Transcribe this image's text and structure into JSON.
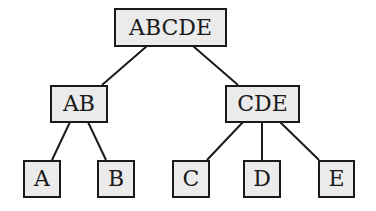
{
  "diagram": {
    "type": "tree",
    "nodes": [
      {
        "id": "ABCDE",
        "label": "ABCDE",
        "x": 114,
        "y": 8,
        "w": 113,
        "h": 39
      },
      {
        "id": "AB",
        "label": "AB",
        "x": 50,
        "y": 85,
        "w": 58,
        "h": 38
      },
      {
        "id": "CDE",
        "label": "CDE",
        "x": 225,
        "y": 85,
        "w": 75,
        "h": 38
      },
      {
        "id": "A",
        "label": "A",
        "x": 23,
        "y": 160,
        "w": 38,
        "h": 38
      },
      {
        "id": "B",
        "label": "B",
        "x": 97,
        "y": 160,
        "w": 38,
        "h": 38
      },
      {
        "id": "C",
        "label": "C",
        "x": 172,
        "y": 160,
        "w": 38,
        "h": 38
      },
      {
        "id": "D",
        "label": "D",
        "x": 243,
        "y": 160,
        "w": 38,
        "h": 38
      },
      {
        "id": "E",
        "label": "E",
        "x": 318,
        "y": 160,
        "w": 37,
        "h": 38
      }
    ],
    "edges": [
      {
        "from": "ABCDE",
        "to": "AB",
        "x1": 147,
        "y1": 46,
        "x2": 102,
        "y2": 85
      },
      {
        "from": "ABCDE",
        "to": "CDE",
        "x1": 193,
        "y1": 46,
        "x2": 238,
        "y2": 85
      },
      {
        "from": "AB",
        "to": "A",
        "x1": 70,
        "y1": 122,
        "x2": 52,
        "y2": 160
      },
      {
        "from": "AB",
        "to": "B",
        "x1": 88,
        "y1": 122,
        "x2": 106,
        "y2": 160
      },
      {
        "from": "CDE",
        "to": "C",
        "x1": 243,
        "y1": 122,
        "x2": 207,
        "y2": 160
      },
      {
        "from": "CDE",
        "to": "D",
        "x1": 262,
        "y1": 122,
        "x2": 262,
        "y2": 160
      },
      {
        "from": "CDE",
        "to": "E",
        "x1": 280,
        "y1": 122,
        "x2": 319,
        "y2": 160
      }
    ],
    "colors": {
      "fill": "#ebebeb",
      "stroke": "#1a1a1a"
    }
  }
}
